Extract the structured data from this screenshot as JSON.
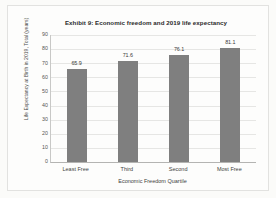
{
  "chart_data": {
    "type": "bar",
    "title": "Exhibit 9: Economic freedom and 2019 life expectancy",
    "categories": [
      "Least Free",
      "Third",
      "Second",
      "Most Free"
    ],
    "values": [
      65.9,
      71.6,
      76.1,
      81.1
    ],
    "value_labels": [
      "65.9",
      "71.6",
      "76.1",
      "81.1"
    ],
    "xlabel": "Economic Freedom Quartile",
    "ylabel": "Life Expectancy at Birth in 2019, Total (years)",
    "ylim": [
      0,
      90
    ],
    "ytick_step": 10,
    "yticks": [
      "0",
      "10",
      "20",
      "30",
      "40",
      "50",
      "60",
      "70",
      "80",
      "90"
    ],
    "grid": "horizontal",
    "legend": "none",
    "series_color": "#7f7f7f",
    "gridline_color": "#e6e6e4",
    "axis_color": "#b4b4b2",
    "background_color": "#fdfdfc"
  }
}
